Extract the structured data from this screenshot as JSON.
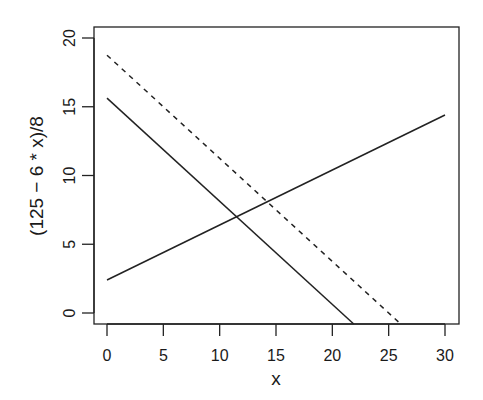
{
  "chart_data": {
    "type": "line",
    "title": "",
    "xlabel": "x",
    "ylabel": "(125 − 6 * x)/8",
    "xlim": [
      -1.2,
      31.2
    ],
    "ylim": [
      -0.8,
      20.8
    ],
    "xticks": [
      0,
      5,
      10,
      15,
      20,
      25,
      30
    ],
    "yticks": [
      0,
      5,
      10,
      15,
      20
    ],
    "xtick_labels": [
      "0",
      "5",
      "10",
      "15",
      "20",
      "25",
      "30"
    ],
    "ytick_labels": [
      "0",
      "5",
      "10",
      "15",
      "20"
    ],
    "grid": false,
    "legend": null,
    "series": [
      {
        "name": "(125 - 6x)/8",
        "style": "solid",
        "color": "#222222",
        "x": [
          0,
          21.9
        ],
        "y": [
          15.625,
          -0.8
        ]
      },
      {
        "name": "(150 - 6x)/8",
        "style": "dashed",
        "color": "#222222",
        "x": [
          0,
          26.07
        ],
        "y": [
          18.75,
          -0.8
        ]
      },
      {
        "name": "ascending line",
        "style": "solid",
        "color": "#222222",
        "x": [
          0,
          30
        ],
        "y": [
          2.4,
          14.4
        ]
      }
    ],
    "annotations": []
  }
}
